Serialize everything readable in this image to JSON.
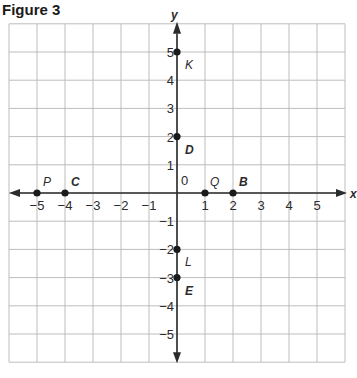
{
  "figure": {
    "title": "Figure 3",
    "x_axis_label": "x",
    "y_axis_label": "y",
    "origin_label": "0",
    "x_ticks": [
      "−5",
      "−4",
      "−3",
      "−2",
      "−1",
      "1",
      "2",
      "3",
      "4",
      "5"
    ],
    "y_ticks": [
      "5",
      "4",
      "3",
      "2",
      "1",
      "−1",
      "−2",
      "−3",
      "−4",
      "−5"
    ],
    "points": [
      {
        "label": "P",
        "x": -5,
        "y": 0,
        "bold": false
      },
      {
        "label": "C",
        "x": -4,
        "y": 0,
        "bold": true
      },
      {
        "label": "Q",
        "x": 1,
        "y": 0,
        "bold": false
      },
      {
        "label": "B",
        "x": 2,
        "y": 0,
        "bold": true
      },
      {
        "label": "K",
        "x": 0,
        "y": 5,
        "bold": false
      },
      {
        "label": "D",
        "x": 0,
        "y": 2,
        "bold": true
      },
      {
        "label": "L",
        "x": 0,
        "y": -2,
        "bold": false
      },
      {
        "label": "E",
        "x": 0,
        "y": -3,
        "bold": true
      }
    ],
    "grid": {
      "xmin": -6,
      "xmax": 6,
      "ymin": -6,
      "ymax": 6
    },
    "colors": {
      "grid": "#bdbdbd",
      "axis": "#2b2b2b",
      "text": "#2b2b2b"
    }
  }
}
